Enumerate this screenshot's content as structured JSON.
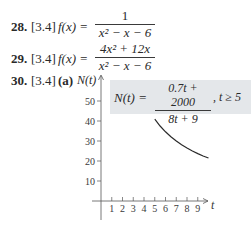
{
  "problems": [
    {
      "number": "28.",
      "section": "[3.4]",
      "lhs": "f(x) =",
      "numerator": "1",
      "denominator": "x² − x − 6"
    },
    {
      "number": "29.",
      "section": "[3.4]",
      "lhs": "f(x) =",
      "numerator": "4x² + 12x",
      "denominator": "x² − x − 6"
    },
    {
      "number": "30.",
      "section": "[3.4]",
      "part": "(a)"
    }
  ],
  "graph_formula": {
    "lhs": "N(t) =",
    "numerator": "0.7t + 2000",
    "denominator": "8t + 9",
    "condition": ", t ≥ 5"
  },
  "colors": {
    "formula_box_bg": "#e4e7ea",
    "curve": "#2a2a2a",
    "axis": "#555555"
  },
  "chart_data": {
    "type": "line",
    "title": "",
    "xlabel": "t",
    "ylabel": "N(t)",
    "x_ticks": [
      1,
      2,
      3,
      4,
      5,
      6,
      7,
      8,
      9
    ],
    "y_ticks": [
      10,
      20,
      30,
      40,
      50
    ],
    "xlim": [
      0,
      10
    ],
    "ylim": [
      0,
      50
    ],
    "grid": false,
    "legend": null,
    "annotation": "N(t) = (0.7t + 2000)/(8t + 9), t ≥ 5",
    "series": [
      {
        "name": "N(t)",
        "x": [
          5,
          5.5,
          6,
          6.5,
          7,
          7.5,
          8,
          8.5,
          9,
          9.5,
          10
        ],
        "values": [
          40.9,
          37.5,
          34.6,
          32.1,
          30.0,
          28.1,
          26.5,
          25.0,
          23.7,
          22.5,
          21.5
        ]
      }
    ]
  }
}
